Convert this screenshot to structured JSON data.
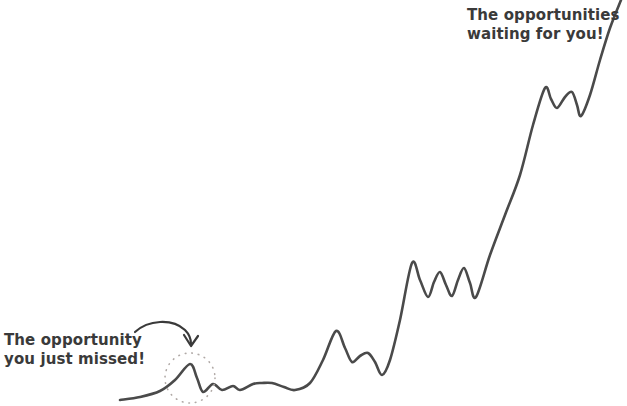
{
  "page": {
    "background_color": "#ffffff",
    "width": 627,
    "height": 406
  },
  "annotations": {
    "missed": {
      "line1": "The opportunity",
      "line2": "you just missed!",
      "color": "#3a3a3a",
      "marker": "dotted-circle",
      "pointer": "curved-arrow"
    },
    "waiting": {
      "line1": "The opportunities",
      "line2": "waiting for you!",
      "color": "#3a3a3a"
    }
  },
  "chart_data": {
    "type": "line",
    "title": "",
    "subtitle": "",
    "xlabel": "",
    "ylabel": "",
    "grid": false,
    "legend": false,
    "axes_visible": false,
    "line_color": "#4a4a4a",
    "line_width": 2.6,
    "xlim": [
      0,
      627
    ],
    "ylim": [
      406,
      0
    ],
    "annotations": [
      {
        "text": "The opportunity you just missed!",
        "x": 5,
        "y": 335,
        "points_to_x": 190,
        "points_to_y": 364,
        "marker": "dotted circle at (190, 378) r=25"
      },
      {
        "text": "The opportunities waiting for you!",
        "x": 468,
        "y": 10,
        "points_to_x": 600,
        "points_to_y": 40
      }
    ],
    "x": [
      120,
      140,
      160,
      175,
      190,
      197,
      203,
      213,
      222,
      233,
      240,
      253,
      262,
      272,
      284,
      295,
      310,
      323,
      336,
      345,
      352,
      360,
      368,
      375,
      382,
      390,
      400,
      412,
      420,
      428,
      434,
      440,
      446,
      452,
      458,
      464,
      470,
      476,
      490,
      505,
      520,
      533,
      545,
      551,
      557,
      565,
      572,
      577,
      581,
      590,
      600,
      610,
      621
    ],
    "y": [
      400,
      397,
      391,
      380,
      364,
      378,
      392,
      384,
      390,
      386,
      390,
      384,
      383,
      383,
      387,
      390,
      383,
      360,
      331,
      348,
      362,
      356,
      353,
      362,
      375,
      360,
      320,
      263,
      280,
      297,
      282,
      272,
      285,
      296,
      280,
      268,
      283,
      297,
      255,
      215,
      175,
      125,
      88,
      99,
      108,
      97,
      92,
      105,
      116,
      95,
      60,
      28,
      0
    ],
    "series": [
      {
        "name": "opportunity-curve",
        "values": [
          400,
          397,
          391,
          380,
          364,
          378,
          392,
          384,
          390,
          386,
          390,
          384,
          383,
          383,
          387,
          390,
          383,
          360,
          331,
          348,
          362,
          356,
          353,
          362,
          375,
          360,
          320,
          263,
          280,
          297,
          282,
          272,
          285,
          296,
          280,
          268,
          283,
          297,
          255,
          215,
          175,
          125,
          88,
          99,
          108,
          97,
          92,
          105,
          116,
          95,
          60,
          28,
          0
        ]
      }
    ]
  }
}
